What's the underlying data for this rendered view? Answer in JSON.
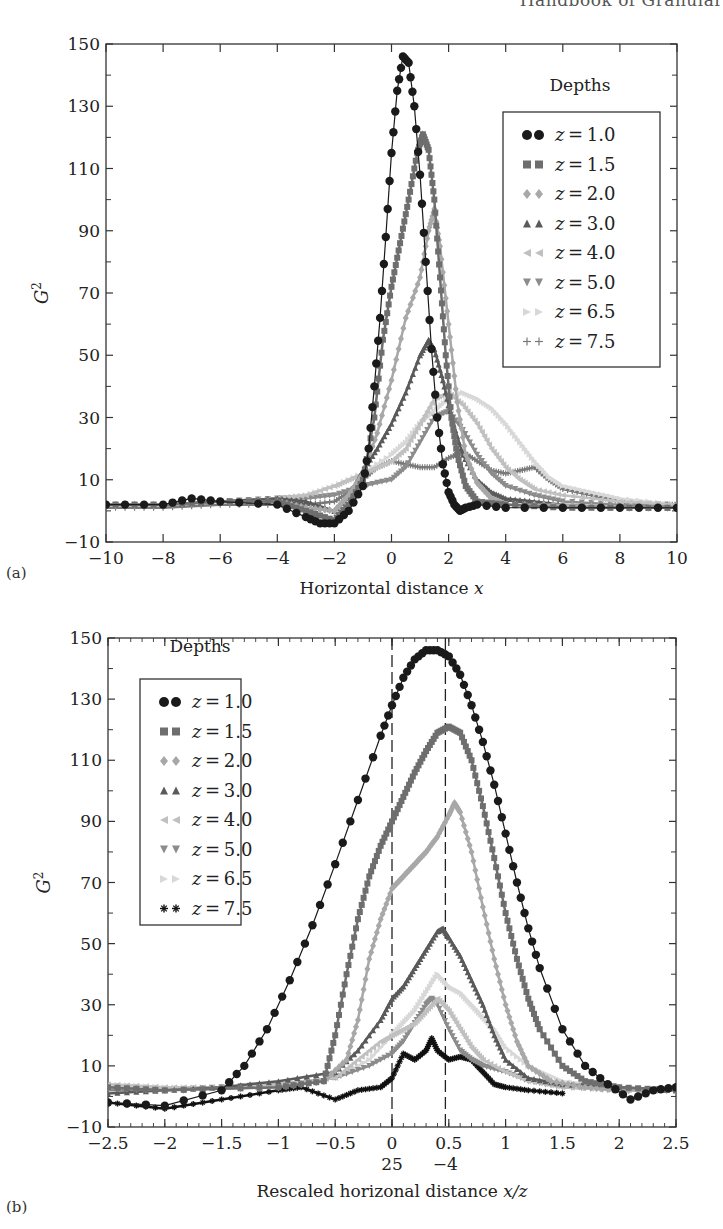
{
  "header": {
    "running_title": "Handbook of Granular"
  },
  "panels": [
    {
      "label": "(a)",
      "legend_title": "Depths",
      "xlabel": "Horizontal distance x",
      "ylabel": "G2"
    },
    {
      "label": "(b)",
      "legend_title": "Depths",
      "xlabel": "Rescaled horizonal distance x/z",
      "ylabel": "G2",
      "extra_xtick_labels": [
        "25",
        "−4"
      ]
    }
  ],
  "chart_data": [
    {
      "type": "line",
      "panel": "(a)",
      "title": "",
      "xlabel": "Horizontal distance x",
      "ylabel": "G^2",
      "xlim": [
        -10,
        10
      ],
      "ylim": [
        -10,
        150
      ],
      "xticks": [
        -10,
        -8,
        -6,
        -4,
        -2,
        0,
        2,
        4,
        6,
        8,
        10
      ],
      "yticks": [
        -10,
        10,
        30,
        50,
        70,
        90,
        110,
        130,
        150
      ],
      "grid": false,
      "legend_title": "Depths",
      "legend_position": "upper right",
      "series": [
        {
          "name": "z = 1.0",
          "marker": "circle",
          "color": "#1a1a1a",
          "x": [
            -10,
            -8,
            -7,
            -6,
            -4,
            -3,
            -2.5,
            -2,
            -1.5,
            -1,
            -0.8,
            -0.6,
            -0.4,
            -0.2,
            0,
            0.2,
            0.4,
            0.6,
            0.8,
            1,
            1.2,
            1.4,
            1.6,
            1.8,
            2,
            2.2,
            2.4,
            2.6,
            3,
            4,
            6,
            8,
            10
          ],
          "y": [
            2,
            2,
            4,
            3,
            2,
            -2,
            -4,
            -4,
            0,
            8,
            20,
            40,
            62,
            88,
            115,
            135,
            146,
            144,
            130,
            108,
            80,
            52,
            30,
            15,
            6,
            2,
            0,
            1,
            2,
            1,
            1,
            1,
            1
          ]
        },
        {
          "name": "z = 1.5",
          "marker": "square",
          "color": "#6e6e6e",
          "x": [
            -10,
            -8,
            -6,
            -4,
            -3,
            -2,
            -1.5,
            -1,
            -0.6,
            -0.3,
            0,
            0.3,
            0.6,
            0.9,
            1.1,
            1.3,
            1.5,
            1.7,
            1.9,
            2.1,
            2.3,
            2.6,
            3,
            4,
            6,
            8,
            10
          ],
          "y": [
            2,
            2,
            3,
            3,
            0,
            -3,
            2,
            10,
            30,
            55,
            72,
            86,
            100,
            115,
            121,
            116,
            100,
            75,
            50,
            30,
            18,
            8,
            3,
            2,
            1,
            1,
            1
          ]
        },
        {
          "name": "z = 2.0",
          "marker": "diamond",
          "color": "#a8a8a8",
          "x": [
            -10,
            -8,
            -6,
            -4,
            -3,
            -2,
            -1.5,
            -1,
            -0.5,
            0,
            0.5,
            1,
            1.3,
            1.5,
            1.7,
            2,
            2.3,
            2.6,
            3,
            3.5,
            4,
            6,
            8,
            10
          ],
          "y": [
            2,
            2,
            3,
            3,
            1,
            0,
            5,
            12,
            25,
            42,
            62,
            75,
            90,
            97,
            85,
            60,
            35,
            18,
            9,
            4,
            2,
            2,
            1,
            1
          ]
        },
        {
          "name": "z = 3.0",
          "marker": "triangle-up",
          "color": "#5a5a5a",
          "x": [
            -10,
            -8,
            -6,
            -4,
            -3,
            -2,
            -1.5,
            -1,
            -0.5,
            0,
            0.5,
            1,
            1.3,
            1.5,
            1.8,
            2.1,
            2.5,
            3,
            3.5,
            4,
            5,
            6,
            8,
            10
          ],
          "y": [
            2,
            2,
            3,
            4,
            3,
            0,
            5,
            13,
            20,
            28,
            38,
            50,
            55,
            52,
            42,
            30,
            18,
            10,
            6,
            4,
            3,
            2,
            1,
            1
          ]
        },
        {
          "name": "z = 4.0",
          "marker": "triangle-left",
          "color": "#c0c0c0",
          "x": [
            -10,
            -8,
            -6,
            -4,
            -3,
            -2,
            -1.5,
            -1,
            -0.5,
            0,
            0.5,
            1,
            1.5,
            2,
            2.5,
            3,
            3.5,
            4,
            4.5,
            5,
            6,
            8,
            10
          ],
          "y": [
            2,
            2,
            3,
            4,
            5,
            8,
            10,
            12,
            14,
            16,
            20,
            28,
            36,
            38,
            34,
            28,
            20,
            14,
            10,
            7,
            5,
            3,
            2
          ]
        },
        {
          "name": "z = 5.0",
          "marker": "triangle-down",
          "color": "#8c8c8c",
          "x": [
            -10,
            -8,
            -6,
            -4,
            -3,
            -2,
            -1,
            0,
            0.5,
            1,
            1.5,
            2,
            2.5,
            3,
            3.5,
            4,
            5,
            6,
            8,
            10
          ],
          "y": [
            2,
            2,
            3,
            4,
            4,
            5,
            8,
            10,
            14,
            22,
            30,
            32,
            26,
            18,
            12,
            8,
            5,
            3,
            2,
            2
          ]
        },
        {
          "name": "z = 6.5",
          "marker": "triangle-right",
          "color": "#d8d8d8",
          "x": [
            -10,
            -8,
            -6,
            -4,
            -3,
            -2,
            -1,
            0,
            0.5,
            1,
            1.5,
            2,
            2.5,
            3,
            3.5,
            4,
            4.5,
            5,
            5.5,
            6,
            7,
            8,
            10
          ],
          "y": [
            2,
            2,
            3,
            4,
            5,
            8,
            12,
            18,
            22,
            28,
            32,
            36,
            38,
            36,
            33,
            28,
            22,
            16,
            11,
            8,
            6,
            4,
            2
          ]
        },
        {
          "name": "z = 7.5",
          "marker": "plus",
          "color": "#7a7a7a",
          "x": [
            -10,
            -8,
            -6,
            -4,
            -3,
            -2,
            -1.5,
            -1,
            -0.5,
            0,
            0.5,
            1,
            1.5,
            2,
            2.5,
            3,
            3.5,
            4,
            4.5,
            5,
            5.5,
            6,
            7,
            8,
            9,
            10
          ],
          "y": [
            1,
            1,
            2,
            2,
            2,
            3,
            6,
            10,
            14,
            16,
            15,
            14,
            14,
            17,
            19,
            16,
            13,
            12,
            13,
            14,
            10,
            7,
            5,
            3,
            2,
            2
          ]
        }
      ]
    },
    {
      "type": "line",
      "panel": "(b)",
      "title": "",
      "xlabel": "Rescaled horizonal distance x/z",
      "ylabel": "G^2",
      "xlim": [
        -2.5,
        2.5
      ],
      "ylim": [
        -10,
        150
      ],
      "xticks": [
        -2.5,
        -2,
        -1.5,
        -1,
        -0.5,
        0,
        0.5,
        1,
        1.5,
        2,
        2.5
      ],
      "yticks": [
        -10,
        10,
        30,
        50,
        70,
        90,
        110,
        130,
        150
      ],
      "extra_xtick_labels": [
        {
          "x": 0.0,
          "label": "25"
        },
        {
          "x": 0.47,
          "label": "−4"
        }
      ],
      "vlines": [
        {
          "x": 0.0,
          "style": "dashed"
        },
        {
          "x": 0.47,
          "style": "dashed"
        }
      ],
      "grid": false,
      "legend_title": "Depths",
      "legend_position": "upper left",
      "series": [
        {
          "name": "z = 1.0",
          "marker": "circle",
          "color": "#1a1a1a",
          "x": [
            -2.5,
            -2,
            -1.5,
            -1.3,
            -1.1,
            -0.9,
            -0.7,
            -0.5,
            -0.3,
            -0.1,
            0,
            0.1,
            0.2,
            0.3,
            0.4,
            0.5,
            0.6,
            0.7,
            0.8,
            0.9,
            1,
            1.1,
            1.2,
            1.3,
            1.5,
            1.7,
            1.9,
            2.1,
            2.3,
            2.5
          ],
          "y": [
            -2,
            -3,
            2,
            10,
            22,
            38,
            56,
            76,
            97,
            118,
            128,
            137,
            143,
            146,
            146,
            144,
            138,
            128,
            116,
            102,
            86,
            70,
            55,
            42,
            22,
            10,
            4,
            -1,
            2,
            3
          ]
        },
        {
          "name": "z = 1.5",
          "marker": "square",
          "color": "#6e6e6e",
          "x": [
            -2.5,
            -2,
            -1,
            -0.6,
            -0.5,
            -0.4,
            -0.3,
            -0.2,
            -0.1,
            0,
            0.1,
            0.2,
            0.3,
            0.4,
            0.5,
            0.6,
            0.7,
            0.8,
            0.9,
            1,
            1.1,
            1.2,
            1.3,
            1.5,
            1.7,
            2,
            2.5
          ],
          "y": [
            3,
            2,
            3,
            5,
            20,
            40,
            58,
            72,
            82,
            90,
            98,
            106,
            113,
            119,
            121,
            119,
            110,
            95,
            78,
            60,
            45,
            32,
            22,
            10,
            5,
            3,
            2
          ]
        },
        {
          "name": "z = 2.0",
          "marker": "diamond",
          "color": "#a8a8a8",
          "x": [
            -2.5,
            -2,
            -1,
            -0.6,
            -0.4,
            -0.3,
            -0.2,
            -0.1,
            0,
            0.1,
            0.2,
            0.3,
            0.4,
            0.5,
            0.55,
            0.6,
            0.7,
            0.8,
            0.9,
            1,
            1.1,
            1.2,
            1.4,
            1.7,
            2,
            2.5
          ],
          "y": [
            3,
            2,
            3,
            5,
            12,
            25,
            45,
            58,
            68,
            72,
            76,
            80,
            85,
            92,
            96,
            93,
            80,
            62,
            45,
            30,
            18,
            10,
            5,
            3,
            2,
            2
          ]
        },
        {
          "name": "z = 3.0",
          "marker": "triangle-up",
          "color": "#5a5a5a",
          "x": [
            -2.5,
            -2,
            -1.5,
            -1,
            -0.5,
            -0.3,
            -0.1,
            0,
            0.1,
            0.2,
            0.3,
            0.4,
            0.45,
            0.5,
            0.6,
            0.7,
            0.8,
            0.9,
            1,
            1.2,
            1.5,
            2,
            2.5
          ],
          "y": [
            1,
            2,
            3,
            5,
            8,
            15,
            25,
            32,
            36,
            42,
            48,
            54,
            55,
            52,
            46,
            38,
            30,
            20,
            12,
            6,
            4,
            3,
            2
          ]
        },
        {
          "name": "z = 4.0",
          "marker": "triangle-left",
          "color": "#c0c0c0",
          "x": [
            -2.5,
            -2,
            -1.5,
            -1,
            -0.5,
            -0.3,
            -0.1,
            0,
            0.1,
            0.2,
            0.3,
            0.4,
            0.5,
            0.6,
            0.7,
            0.8,
            1,
            1.2,
            1.5,
            2,
            2.5
          ],
          "y": [
            4,
            3,
            3,
            4,
            6,
            12,
            18,
            20,
            22,
            24,
            28,
            32,
            28,
            22,
            16,
            12,
            8,
            5,
            3,
            2,
            2
          ]
        },
        {
          "name": "z = 5.0",
          "marker": "triangle-down",
          "color": "#8c8c8c",
          "x": [
            -2.5,
            -2,
            -1.5,
            -1,
            -0.5,
            -0.2,
            0,
            0.1,
            0.2,
            0.3,
            0.35,
            0.4,
            0.5,
            0.6,
            0.7,
            0.8,
            1,
            1.2,
            1.5,
            2,
            2.5
          ],
          "y": [
            2,
            2,
            3,
            4,
            6,
            10,
            14,
            18,
            24,
            30,
            32,
            30,
            22,
            15,
            12,
            10,
            8,
            5,
            3,
            2,
            2
          ]
        },
        {
          "name": "z = 6.5",
          "marker": "triangle-right",
          "color": "#d8d8d8",
          "x": [
            -2.5,
            -2,
            -1.5,
            -1,
            -0.5,
            -0.2,
            0,
            0.1,
            0.2,
            0.3,
            0.4,
            0.5,
            0.6,
            0.7,
            0.8,
            0.9,
            1,
            1.2,
            1.5,
            2,
            2.5
          ],
          "y": [
            4,
            3,
            3,
            4,
            6,
            12,
            20,
            24,
            28,
            34,
            40,
            36,
            34,
            30,
            26,
            22,
            16,
            10,
            5,
            3,
            2
          ]
        },
        {
          "name": "z = 7.5",
          "marker": "star",
          "color": "#111111",
          "x": [
            -2.5,
            -2,
            -1.5,
            -1,
            -0.8,
            -0.5,
            -0.3,
            -0.1,
            0,
            0.1,
            0.2,
            0.3,
            0.35,
            0.4,
            0.5,
            0.6,
            0.7,
            0.8,
            0.9,
            1,
            1.2,
            1.5
          ],
          "y": [
            -2,
            -4,
            -1,
            2,
            3,
            -1,
            2,
            3,
            6,
            14,
            12,
            15,
            19,
            15,
            12,
            13,
            12,
            8,
            4,
            3,
            2,
            1
          ]
        }
      ]
    }
  ]
}
